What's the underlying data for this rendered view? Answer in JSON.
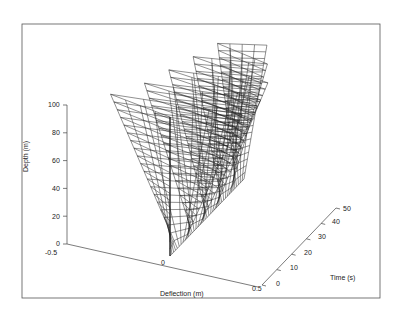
{
  "chart_data": {
    "type": "surface3d",
    "title": "",
    "xlabel": "Deflection (m)",
    "ylabel": "Time (s)",
    "zlabel": "Depth (m)",
    "x_ticks": [
      "-0.5",
      "0",
      "0.5"
    ],
    "y_ticks": [
      "0",
      "10",
      "20",
      "30",
      "40",
      "50"
    ],
    "z_ticks": [
      "0",
      "20",
      "40",
      "60",
      "80",
      "100"
    ],
    "xlim": [
      -0.5,
      0.5
    ],
    "ylim": [
      0,
      50
    ],
    "zlim": [
      0,
      100
    ],
    "grid": false,
    "legend": null,
    "series": [
      {
        "name": "deflection envelope",
        "depth": [
          0,
          20,
          40,
          60,
          80,
          100
        ],
        "max_deflection": [
          0,
          0.07,
          0.14,
          0.21,
          0.28,
          0.35
        ],
        "min_deflection": [
          0,
          -0.07,
          -0.14,
          -0.21,
          -0.28,
          -0.35
        ]
      }
    ],
    "time_samples": [
      0,
      5,
      10,
      15,
      20,
      25,
      30,
      35,
      40,
      45,
      50
    ],
    "top_deflection_by_time": [
      0.0,
      -0.35,
      0.3,
      -0.25,
      0.32,
      -0.2,
      0.28,
      -0.15,
      0.2,
      -0.1,
      0.12
    ]
  },
  "labels": {
    "depth_axis_title": "Depth (m)",
    "time_axis_title": "Time (s)",
    "deflection_axis_title": "Deflection (m)"
  },
  "colors": {
    "line": "#222222",
    "frame": "#555555",
    "background": "#ffffff"
  }
}
